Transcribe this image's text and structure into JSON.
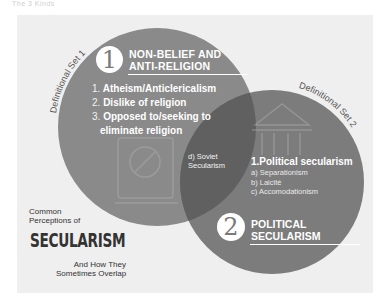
{
  "page": {
    "top_crop_text": "The 3 Kinds"
  },
  "colors": {
    "panel": "#efefef",
    "circle1": "#8a8a8a",
    "circle2": "#7a7a7a",
    "overlap": "#6a6a6a",
    "text_light": "#ffffff",
    "caption": "#333333"
  },
  "set1": {
    "arc_label": "Definitional Set 1",
    "badge": "1",
    "title_line1": "NON-BELIEF AND",
    "title_line2": "ANTI-RELIGION",
    "items": [
      {
        "num": "1.",
        "text": "Atheism/Anticlericalism"
      },
      {
        "num": "2.",
        "text": "Dislike of religion"
      },
      {
        "num": "3.",
        "text": "Opposed to/seeking to"
      },
      {
        "num": "",
        "text": "eliminate religion"
      }
    ],
    "icon": "prohibited-book-icon"
  },
  "overlap": {
    "line1": "d) Soviet",
    "line2": "Secularism"
  },
  "set2": {
    "arc_label": "Definitional Set 2",
    "badge": "2",
    "title_line1": "POLITICAL",
    "title_line2": "SECULARISM",
    "heading": "1.Political secularism",
    "sub_items": [
      "a) Separationism",
      "b) Laicité",
      "c) Accomodationism"
    ],
    "icon": "government-building-icon"
  },
  "caption": {
    "line1": "Common",
    "line2": "Perceptions of",
    "title": "SECULARISM",
    "sub1": "And How They",
    "sub2": "Sometimes Overlap"
  }
}
